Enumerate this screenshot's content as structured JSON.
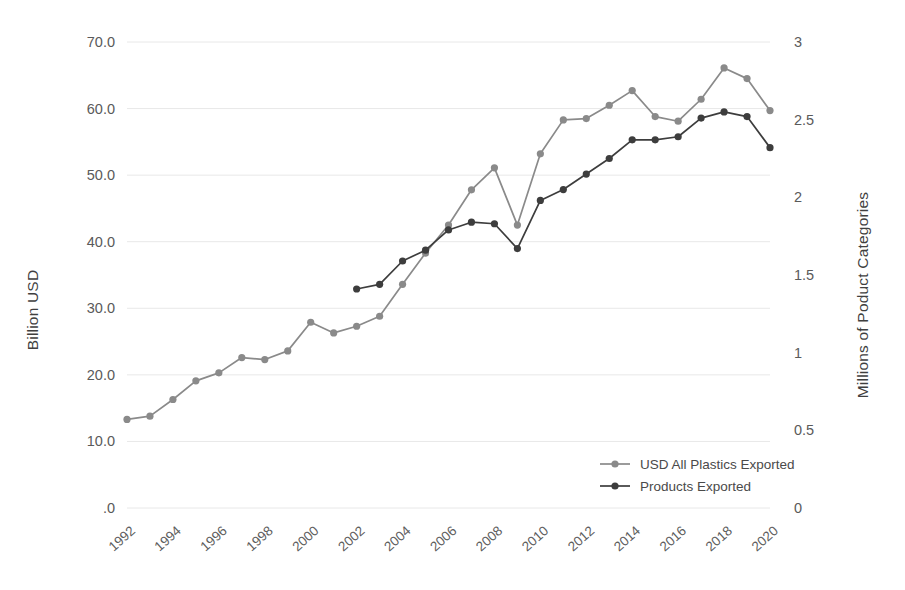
{
  "chart_data": {
    "type": "line",
    "title": "",
    "xlabel": "",
    "ylabel": "Billion USD",
    "y2label": "Millions of Poduct Categories",
    "x": [
      1992,
      1993,
      1994,
      1995,
      1996,
      1997,
      1998,
      1999,
      2000,
      2001,
      2002,
      2003,
      2004,
      2005,
      2006,
      2007,
      2008,
      2009,
      2010,
      2011,
      2012,
      2013,
      2014,
      2015,
      2016,
      2017,
      2018,
      2019,
      2020
    ],
    "xtick_labels": [
      "1992",
      "1994",
      "1996",
      "1998",
      "2000",
      "2002",
      "2004",
      "2006",
      "2008",
      "2010",
      "2012",
      "2014",
      "2016",
      "2018",
      "2020"
    ],
    "xticks": [
      1992,
      1994,
      1996,
      1998,
      2000,
      2002,
      2004,
      2006,
      2008,
      2010,
      2012,
      2014,
      2016,
      2018,
      2020
    ],
    "ylim": [
      0,
      70
    ],
    "yticks": [
      0,
      10,
      20,
      30,
      40,
      50,
      60,
      70
    ],
    "ytick_labels": [
      ".0",
      "10.0",
      "20.0",
      "30.0",
      "40.0",
      "50.0",
      "60.0",
      "70.0"
    ],
    "y2lim": [
      0,
      3
    ],
    "y2ticks": [
      0,
      0.5,
      1,
      1.5,
      2,
      2.5,
      3
    ],
    "y2tick_labels": [
      "0",
      "0.5",
      "1",
      "1.5",
      "2",
      "2.5",
      "3"
    ],
    "grid": true,
    "legend_position": "inside-lower-right",
    "series": [
      {
        "name": "USD All  Plastics Exported",
        "axis": "left",
        "color": "#8a8a8a",
        "x": [
          1992,
          1993,
          1994,
          1995,
          1996,
          1997,
          1998,
          1999,
          2000,
          2001,
          2002,
          2003,
          2004,
          2005,
          2006,
          2007,
          2008,
          2009,
          2010,
          2011,
          2012,
          2013,
          2014,
          2015,
          2016,
          2017,
          2018,
          2019,
          2020
        ],
        "values": [
          13.3,
          13.8,
          16.3,
          19.1,
          20.3,
          22.6,
          22.3,
          23.6,
          27.9,
          26.3,
          27.3,
          28.8,
          33.6,
          38.3,
          42.5,
          47.8,
          51.1,
          42.5,
          53.2,
          58.3,
          58.5,
          60.5,
          62.7,
          58.8,
          58.1,
          61.4,
          66.1,
          64.5,
          59.7
        ]
      },
      {
        "name": "Products Exported",
        "axis": "right",
        "color": "#3d3d3d",
        "x": [
          2002,
          2003,
          2004,
          2005,
          2006,
          2007,
          2008,
          2009,
          2010,
          2011,
          2012,
          2013,
          2014,
          2015,
          2016,
          2017,
          2018,
          2019,
          2020
        ],
        "values": [
          1.41,
          1.44,
          1.59,
          1.66,
          1.79,
          1.84,
          1.83,
          1.67,
          1.98,
          2.05,
          2.15,
          2.25,
          2.37,
          2.37,
          2.39,
          2.51,
          2.55,
          2.52,
          2.32
        ],
        "values_left_scale": [
          32.3,
          32.8,
          37.1,
          38.7,
          41.8,
          42.8,
          42.7,
          38.9,
          46.2,
          47.8,
          50.1,
          52.4,
          55.3,
          55.3,
          55.7,
          58.5,
          59.5,
          58.8,
          54.1
        ]
      }
    ],
    "legend": [
      {
        "label": "USD All  Plastics Exported",
        "color": "#8a8a8a"
      },
      {
        "label": "Products Exported",
        "color": "#3d3d3d"
      }
    ]
  }
}
